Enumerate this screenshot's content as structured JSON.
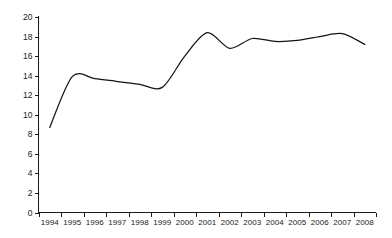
{
  "chart_data": {
    "type": "line",
    "title": "",
    "xlabel": "",
    "ylabel": "",
    "categories": [
      "1994",
      "1995",
      "1996",
      "1997",
      "1998",
      "1999",
      "2000",
      "2001",
      "2002",
      "2003",
      "2004",
      "2005",
      "2006",
      "2007",
      "2008"
    ],
    "values": [
      8.7,
      13.9,
      13.7,
      13.4,
      13.1,
      12.8,
      16.0,
      18.4,
      16.8,
      17.8,
      17.5,
      17.6,
      18.0,
      18.3,
      17.2
    ],
    "series": [
      {
        "name": "series-1",
        "values": [
          8.7,
          13.9,
          13.7,
          13.4,
          13.1,
          12.8,
          16.0,
          18.4,
          16.8,
          17.8,
          17.5,
          17.6,
          18.0,
          18.3,
          17.2
        ]
      }
    ],
    "ylim": [
      0,
      20
    ],
    "y_ticks": [
      "0",
      "2",
      "4",
      "6",
      "8",
      "10",
      "12",
      "14",
      "16",
      "18",
      "20"
    ],
    "y_tick_values": [
      0,
      2,
      4,
      6,
      8,
      10,
      12,
      14,
      16,
      18,
      20
    ],
    "x_ticks": [
      "1994",
      "1995",
      "1996",
      "1997",
      "1998",
      "1999",
      "2000",
      "2001",
      "2002",
      "2003",
      "2004",
      "2005",
      "2006",
      "2007",
      "2008"
    ],
    "grid": false,
    "legend": false,
    "legend_position": "none",
    "line_color": "#141414",
    "axis_color": "#1a1a1a",
    "background_color": "#ffffff",
    "smoothing": "spline"
  }
}
